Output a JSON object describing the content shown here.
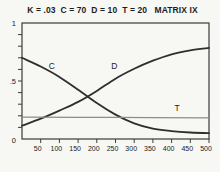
{
  "figure": {
    "title": "K = .03  C = 70  D = 10  T = 20   MATRIX IX",
    "params": {
      "K": ".03",
      "C": "70",
      "D": "10",
      "T": "20",
      "matrix_label": "MATRIX IX"
    }
  },
  "chart_data": {
    "type": "line",
    "title": "K = .03  C = 70  D = 10  T = 20   MATRIX IX",
    "xlabel": "",
    "ylabel": "",
    "xlim": [
      0,
      500
    ],
    "ylim": [
      0,
      1
    ],
    "x_ticks": [
      50,
      100,
      150,
      200,
      250,
      300,
      350,
      400,
      450,
      500
    ],
    "y_ticks": [
      {
        "value": 1,
        "label": "1"
      },
      {
        "value": 0.5,
        "label": ".5"
      },
      {
        "value": 0,
        "label": "0"
      }
    ],
    "y_minor_tick_step": 0.1,
    "grid": false,
    "frame": true,
    "legend": "inline-curve-labels",
    "colors": {
      "curve": "#2e2e2e",
      "t_line": "#8c8c8c",
      "axis": "#3a3a3a",
      "text": "#222222",
      "background": "#f7f7f4"
    },
    "series": [
      {
        "name": "C",
        "points": [
          [
            0,
            0.7
          ],
          [
            50,
            0.625
          ],
          [
            100,
            0.535
          ],
          [
            150,
            0.425
          ],
          [
            200,
            0.31
          ],
          [
            250,
            0.21
          ],
          [
            300,
            0.135
          ],
          [
            350,
            0.09
          ],
          [
            400,
            0.068
          ],
          [
            450,
            0.056
          ],
          [
            500,
            0.05
          ]
        ],
        "label_at": {
          "x": 80,
          "y": 0.6
        }
      },
      {
        "name": "D",
        "points": [
          [
            0,
            0.115
          ],
          [
            50,
            0.175
          ],
          [
            100,
            0.245
          ],
          [
            150,
            0.32
          ],
          [
            200,
            0.415
          ],
          [
            250,
            0.52
          ],
          [
            300,
            0.605
          ],
          [
            350,
            0.675
          ],
          [
            400,
            0.73
          ],
          [
            450,
            0.765
          ],
          [
            500,
            0.785
          ]
        ],
        "label_at": {
          "x": 247,
          "y": 0.6
        }
      },
      {
        "name": "T",
        "points": [
          [
            0,
            0.188
          ],
          [
            250,
            0.186
          ],
          [
            500,
            0.183
          ]
        ],
        "label_at": {
          "x": 415,
          "y": 0.245
        },
        "color_key": "t_line"
      }
    ]
  }
}
